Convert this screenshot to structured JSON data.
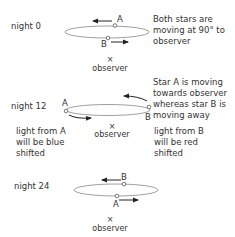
{
  "panels": [
    {
      "night_label": "night 0",
      "star_a": "A",
      "star_b": "B",
      "observer_mark": "×",
      "observer_label": "observer",
      "note_lines": [
        "Both stars are",
        "moving at 90° to",
        "observer"
      ]
    },
    {
      "night_label": "night 12",
      "star_a": "A",
      "star_b": "B",
      "observer_mark": "×",
      "observer_label": "observer",
      "note_lines": [
        "Star A is moving",
        "towards observer",
        "whereas star B is",
        "moving away"
      ],
      "left_note_lines": [
        "light from A",
        "will be blue",
        "shifted"
      ],
      "right_note_lines": [
        "light from B",
        "will be red",
        "shifted"
      ]
    },
    {
      "night_label": "night 24",
      "star_a": "A",
      "star_b": "B",
      "observer_mark": "×",
      "observer_label": "observer"
    }
  ],
  "colors": {
    "line": "#555555",
    "ellipse": "#888888",
    "text": "#333333"
  }
}
